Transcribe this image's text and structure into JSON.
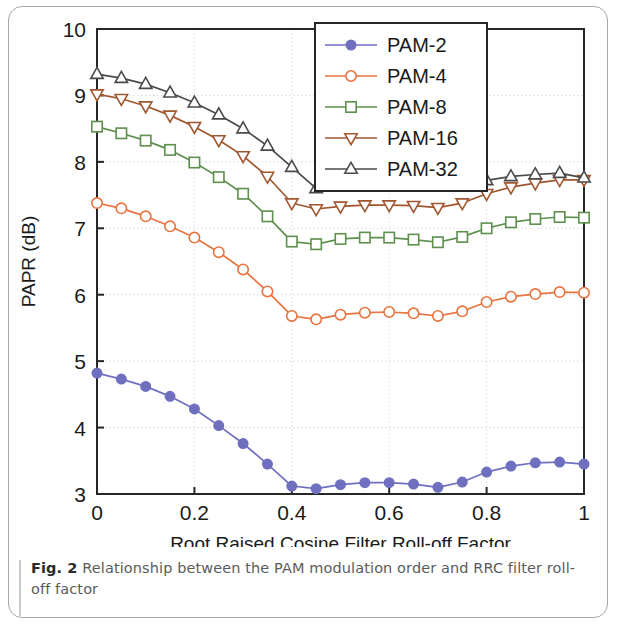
{
  "figure": {
    "caption_label": "Fig. 2",
    "caption_text": " Relationship between the PAM modulation order and RRC filter roll-off factor"
  },
  "chart_data": {
    "type": "line",
    "title": "",
    "xlabel": "Root Raised Cosine Filter Roll-off Factor",
    "ylabel": "PAPR (dB)",
    "xlim": [
      0,
      1
    ],
    "ylim": [
      3,
      10
    ],
    "xticks": [
      0,
      0.2,
      0.4,
      0.6,
      0.8,
      1
    ],
    "xtick_labels": [
      "0",
      "0.2",
      "0.4",
      "0.6",
      "0.8",
      "1"
    ],
    "yticks": [
      3,
      4,
      5,
      6,
      7,
      8,
      9,
      10
    ],
    "ytick_labels": [
      "3",
      "4",
      "5",
      "6",
      "7",
      "8",
      "9",
      "10"
    ],
    "grid": true,
    "legend_position": "upper center",
    "x": [
      0,
      0.05,
      0.1,
      0.15,
      0.2,
      0.25,
      0.3,
      0.35,
      0.4,
      0.45,
      0.5,
      0.55,
      0.6,
      0.65,
      0.7,
      0.75,
      0.8,
      0.85,
      0.9,
      0.95,
      1.0
    ],
    "series": [
      {
        "name": "PAM-2",
        "color": "#6f6fc0",
        "marker": "circle-filled",
        "values": [
          4.82,
          4.73,
          4.62,
          4.47,
          4.28,
          4.03,
          3.76,
          3.45,
          3.12,
          3.08,
          3.14,
          3.17,
          3.17,
          3.15,
          3.1,
          3.18,
          3.33,
          3.42,
          3.47,
          3.48,
          3.45
        ]
      },
      {
        "name": "PAM-4",
        "color": "#e8733f",
        "marker": "circle-open",
        "values": [
          7.38,
          7.3,
          7.18,
          7.03,
          6.86,
          6.64,
          6.38,
          6.05,
          5.68,
          5.63,
          5.7,
          5.73,
          5.74,
          5.72,
          5.68,
          5.75,
          5.89,
          5.97,
          6.01,
          6.04,
          6.03
        ]
      },
      {
        "name": "PAM-8",
        "color": "#5d8f4d",
        "marker": "square-open",
        "values": [
          8.53,
          8.43,
          8.32,
          8.18,
          7.99,
          7.77,
          7.52,
          7.18,
          6.8,
          6.76,
          6.84,
          6.86,
          6.86,
          6.83,
          6.79,
          6.87,
          7.0,
          7.09,
          7.14,
          7.17,
          7.16
        ]
      },
      {
        "name": "PAM-16",
        "color": "#a0562f",
        "marker": "triangle-down-open",
        "values": [
          9.02,
          8.95,
          8.84,
          8.7,
          8.53,
          8.33,
          8.09,
          7.78,
          7.38,
          7.29,
          7.33,
          7.35,
          7.35,
          7.34,
          7.31,
          7.38,
          7.52,
          7.62,
          7.68,
          7.73,
          7.73
        ]
      },
      {
        "name": "PAM-32",
        "color": "#4a4a4a",
        "marker": "triangle-up-open",
        "values": [
          9.32,
          9.26,
          9.17,
          9.04,
          8.89,
          8.71,
          8.5,
          8.24,
          7.92,
          7.6,
          7.62,
          7.63,
          7.64,
          7.64,
          7.63,
          7.66,
          7.72,
          7.78,
          7.81,
          7.83,
          7.76
        ]
      }
    ]
  }
}
